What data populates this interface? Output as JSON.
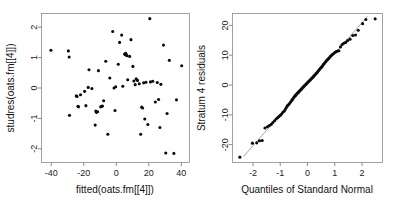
{
  "figure": {
    "title": "",
    "background": "#ffffff",
    "point_color": "#0a0a0a",
    "line_color": "#7a7a7a",
    "box_color": "#8a8a8a"
  },
  "chart_data": [
    {
      "type": "scatter",
      "name": "residuals-vs-fitted",
      "title": "",
      "xlabel": "fitted(oats.fm[[4]])",
      "ylabel": "studres(oats.fm[[4]])",
      "xlim": [
        -46,
        45
      ],
      "ylim": [
        -2.45,
        2.45
      ],
      "xticks": [
        -40,
        -20,
        0,
        20,
        40
      ],
      "xticklabels": [
        "-40",
        "-20",
        "0",
        "20",
        "40"
      ],
      "yticks": [
        -2,
        -1,
        0,
        1,
        2
      ],
      "yticklabels": [
        "-2",
        "-1",
        "0",
        "1",
        "2"
      ],
      "grid": false,
      "legend": null,
      "x": [
        -40.2,
        -29.5,
        -29.0,
        -28.8,
        -24.6,
        -24.1,
        -23.6,
        -23.2,
        -22.0,
        -19.5,
        -18.7,
        -17.3,
        -16.8,
        -15.0,
        -13.0,
        -12.6,
        -12.2,
        -11.5,
        -11.0,
        -9.6,
        -9.0,
        -8.5,
        -7.8,
        -6.5,
        -5.2,
        -4.0,
        -2.2,
        -1.4,
        -0.8,
        -0.4,
        1.2,
        2.0,
        3.3,
        4.0,
        5.1,
        5.4,
        5.8,
        6.2,
        6.6,
        7.0,
        8.2,
        9.0,
        10.2,
        10.8,
        11.6,
        12.2,
        13.0,
        14.1,
        15.0,
        15.6,
        16.2,
        16.8,
        17.5,
        18.2,
        19.4,
        20.6,
        21.0,
        22.4,
        24.0,
        25.2,
        26.0,
        26.8,
        27.4,
        29.0,
        30.4,
        31.2,
        32.6,
        35.4,
        37.0,
        40.2
      ],
      "y": [
        1.24,
        1.22,
        1.02,
        -0.9,
        -0.26,
        -0.28,
        -0.6,
        -0.62,
        -0.22,
        -0.11,
        -0.58,
        0.02,
        0.6,
        -0.02,
        -1.22,
        -0.76,
        -0.8,
        -0.78,
        0.57,
        -0.62,
        -0.6,
        -0.59,
        -0.42,
        0.88,
        -1.52,
        0.33,
        1.86,
        0.0,
        -0.74,
        0.04,
        0.78,
        1.5,
        1.74,
        0.06,
        1.12,
        1.1,
        1.14,
        1.08,
        1.06,
        0.27,
        1.04,
        1.59,
        0.71,
        0.23,
        0.11,
        0.3,
        0.25,
        0.14,
        -1.52,
        -0.63,
        -0.66,
        0.17,
        -1.02,
        0.19,
        -1.2,
        2.28,
        0.2,
        0.22,
        -0.46,
        0.18,
        -0.38,
        -1.3,
        0.12,
        1.41,
        -2.14,
        -0.84,
        0.91,
        -2.15,
        -0.39,
        0.73
      ]
    },
    {
      "type": "scatter",
      "name": "normal-qq-plot",
      "title": "",
      "xlabel": "Quantiles of Standard Normal",
      "ylabel": "Stratum 4 residuals",
      "xlim": [
        -2.75,
        2.75
      ],
      "ylim": [
        -26,
        24
      ],
      "xticks": [
        -2,
        -1,
        0,
        1,
        2
      ],
      "xticklabels": [
        "-2",
        "-1",
        "0",
        "1",
        "2"
      ],
      "yticks": [
        -20,
        -10,
        0,
        10,
        20
      ],
      "yticklabels": [
        "-20",
        "-10",
        "0",
        "10",
        "20"
      ],
      "grid": false,
      "legend": null,
      "reference_line": {
        "x1": -2.35,
        "y1": -24.0,
        "x2": 2.2,
        "y2": 23.0
      },
      "x": [
        -2.48,
        -2.02,
        -1.86,
        -1.76,
        -1.66,
        -1.56,
        -1.47,
        -1.4,
        -1.33,
        -1.27,
        -1.21,
        -1.15,
        -1.1,
        -1.05,
        -1.0,
        -0.95,
        -0.91,
        -0.86,
        -0.82,
        -0.78,
        -0.74,
        -0.7,
        -0.66,
        -0.62,
        -0.58,
        -0.55,
        -0.51,
        -0.47,
        -0.44,
        -0.4,
        -0.37,
        -0.33,
        -0.3,
        -0.26,
        -0.23,
        -0.2,
        -0.16,
        -0.13,
        -0.1,
        -0.06,
        -0.03,
        0.0,
        0.03,
        0.06,
        0.1,
        0.13,
        0.16,
        0.2,
        0.23,
        0.26,
        0.3,
        0.33,
        0.37,
        0.4,
        0.44,
        0.47,
        0.51,
        0.55,
        0.58,
        0.62,
        0.66,
        0.7,
        0.74,
        0.78,
        0.82,
        0.86,
        0.91,
        0.95,
        1.0,
        1.05,
        1.1,
        1.15,
        1.21,
        1.27,
        1.33,
        1.4,
        1.47,
        1.56,
        1.66,
        1.76,
        1.86,
        2.02,
        2.14,
        2.48
      ],
      "y": [
        -24.2,
        -19.5,
        -19.4,
        -18.7,
        -18.6,
        -14.4,
        -14.0,
        -13.6,
        -13.2,
        -12.6,
        -12.0,
        -11.4,
        -11.0,
        -10.6,
        -10.2,
        -9.7,
        -9.2,
        -8.8,
        -8.2,
        -7.6,
        -7.0,
        -6.6,
        -6.2,
        -5.7,
        -5.2,
        -4.8,
        -4.2,
        -3.8,
        -3.4,
        -3.0,
        -2.7,
        -2.4,
        -2.0,
        -1.7,
        -1.4,
        -1.0,
        -0.7,
        -0.4,
        -0.1,
        0.2,
        0.5,
        0.8,
        1.1,
        1.4,
        1.7,
        2.0,
        2.3,
        2.6,
        3.0,
        3.3,
        3.7,
        4.0,
        4.4,
        4.8,
        5.2,
        5.6,
        6.0,
        6.4,
        6.9,
        7.3,
        7.8,
        8.2,
        8.6,
        9.0,
        9.4,
        9.8,
        10.2,
        10.5,
        10.9,
        11.2,
        11.4,
        11.5,
        12.8,
        13.6,
        14.0,
        14.3,
        14.9,
        15.4,
        16.6,
        16.8,
        18.4,
        20.6,
        22.0,
        22.2
      ]
    }
  ]
}
